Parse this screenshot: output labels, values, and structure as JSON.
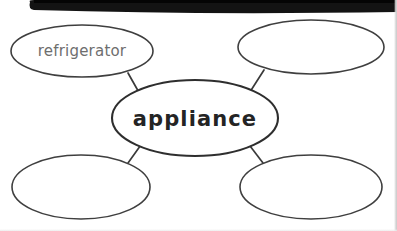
{
  "worksheet": {
    "type": "word-web",
    "title_word": "appliance",
    "background_color": "#ffffff",
    "ink_color": "#3a3a3a",
    "scan_bar_color": "#111111"
  },
  "center_node": {
    "label": "appliance",
    "cx": 195,
    "cy": 118,
    "rx": 83,
    "ry": 38,
    "filled": true
  },
  "branch_nodes": [
    {
      "id": "top-left",
      "label": "refrigerator",
      "cx": 82,
      "cy": 51,
      "rx": 71,
      "ry": 26,
      "filled": true
    },
    {
      "id": "top-right",
      "label": "",
      "cx": 311,
      "cy": 47,
      "rx": 73,
      "ry": 27,
      "filled": false
    },
    {
      "id": "bottom-left",
      "label": "",
      "cx": 81,
      "cy": 187,
      "rx": 69,
      "ry": 32,
      "filled": false
    },
    {
      "id": "bottom-right",
      "label": "",
      "cx": 311,
      "cy": 187,
      "rx": 71,
      "ry": 32,
      "filled": false
    }
  ],
  "connectors": [
    {
      "id": "center-to-top-left",
      "x1": 141,
      "y1": 96,
      "x2": 128,
      "y2": 73
    },
    {
      "id": "center-to-top-right",
      "x1": 248,
      "y1": 95,
      "x2": 264,
      "y2": 70
    },
    {
      "id": "center-to-bottom-left",
      "x1": 143,
      "y1": 142,
      "x2": 128,
      "y2": 163
    },
    {
      "id": "center-to-bottom-right",
      "x1": 247,
      "y1": 142,
      "x2": 263,
      "y2": 163
    }
  ],
  "scan_bar": {
    "label": "scan-shadow-bar",
    "left": 28,
    "right": 397,
    "height": 13
  }
}
